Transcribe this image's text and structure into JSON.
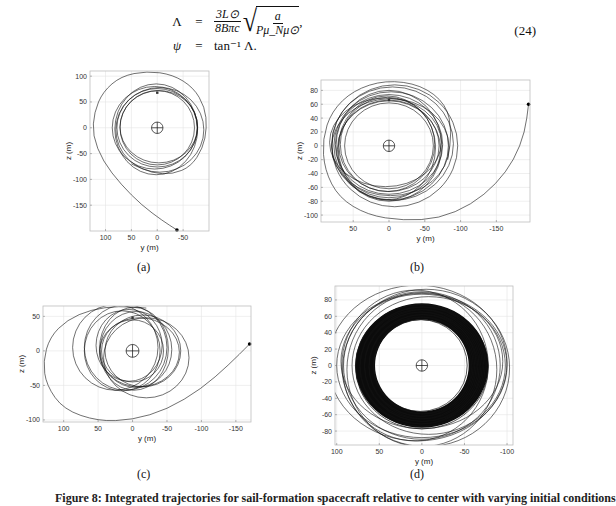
{
  "equation": {
    "number": "(24)",
    "line1": {
      "lhs": "Λ",
      "eq": "=",
      "frac_num": "3L⊙",
      "frac_den": "8Bπc",
      "sqrt_num": "a",
      "sqrt_den": "Pμ_Nμ⊙",
      "trail": ","
    },
    "line2": {
      "lhs": "ψ",
      "eq": "=",
      "rhs": "tan⁻¹ Λ."
    }
  },
  "caption": {
    "text": "Figure 8: Integrated trajectories for sail-formation spacecraft relative to center with varying initial conditions"
  },
  "chart_data": [
    {
      "id": "a",
      "sublabel": "(a)",
      "type": "line",
      "xlabel": "y (m)",
      "ylabel": "z (m)",
      "xlim": [
        130,
        -100
      ],
      "ylim": [
        -200,
        110
      ],
      "xticks": [
        100,
        50,
        0,
        -50
      ],
      "yticks": [
        100,
        50,
        0,
        -50,
        -100,
        -150
      ],
      "grid": true,
      "start_point": [
        -38,
        -198
      ],
      "approach": [
        [
          -38,
          -198
        ],
        [
          -10,
          -180
        ],
        [
          30,
          -150
        ],
        [
          70,
          -110
        ],
        [
          105,
          -65
        ],
        [
          125,
          -15
        ],
        [
          122,
          30
        ],
        [
          105,
          70
        ],
        [
          70,
          100
        ],
        [
          20,
          110
        ],
        [
          -30,
          103
        ],
        [
          -70,
          78
        ],
        [
          -92,
          40
        ],
        [
          -96,
          0
        ],
        [
          -88,
          -40
        ],
        [
          -65,
          -75
        ],
        [
          -30,
          -90
        ],
        [
          10,
          -88
        ],
        [
          50,
          -70
        ]
      ],
      "rings": [
        [
          0,
          0,
          72,
          72
        ],
        [
          0,
          0,
          78,
          76
        ],
        [
          -5,
          -4,
          85,
          82
        ],
        [
          2,
          -3,
          80,
          88
        ],
        [
          -3,
          2,
          75,
          70
        ],
        [
          5,
          0,
          82,
          80
        ]
      ],
      "marker": [
        0,
        68
      ],
      "target_radius": 8
    },
    {
      "id": "b",
      "sublabel": "(b)",
      "type": "line",
      "xlabel": "y (m)",
      "ylabel": "z (m)",
      "xlim": [
        95,
        -197
      ],
      "ylim": [
        -110,
        95
      ],
      "xticks": [
        50,
        0,
        -50,
        -100,
        -150
      ],
      "yticks": [
        80,
        60,
        40,
        20,
        0,
        -20,
        -40,
        -60,
        -80,
        -100
      ],
      "grid": true,
      "start_point": [
        -195,
        60
      ],
      "approach": [
        [
          -195,
          60
        ],
        [
          -190,
          20
        ],
        [
          -175,
          -20
        ],
        [
          -150,
          -55
        ],
        [
          -115,
          -85
        ],
        [
          -70,
          -105
        ],
        [
          -20,
          -108
        ],
        [
          30,
          -100
        ],
        [
          70,
          -75
        ],
        [
          90,
          -35
        ],
        [
          93,
          10
        ],
        [
          80,
          50
        ],
        [
          50,
          80
        ],
        [
          5,
          95
        ],
        [
          -45,
          88
        ],
        [
          -80,
          60
        ],
        [
          -88,
          20
        ],
        [
          -82,
          -20
        ]
      ],
      "rings": [
        [
          0,
          0,
          62,
          62
        ],
        [
          0,
          0,
          70,
          66
        ],
        [
          0,
          2,
          75,
          72
        ],
        [
          -3,
          0,
          80,
          78
        ],
        [
          3,
          -3,
          68,
          75
        ],
        [
          -5,
          3,
          85,
          82
        ],
        [
          0,
          -5,
          72,
          70
        ],
        [
          5,
          5,
          78,
          64
        ],
        [
          -8,
          0,
          88,
          88
        ],
        [
          2,
          2,
          66,
          68
        ],
        [
          0,
          0,
          74,
          80
        ],
        [
          -2,
          -2,
          82,
          70
        ]
      ],
      "marker": [
        0,
        66
      ],
      "target_radius": 8
    },
    {
      "id": "c",
      "sublabel": "(c)",
      "type": "line",
      "xlabel": "y (m)",
      "ylabel": "z (m)",
      "xlim": [
        130,
        -172
      ],
      "ylim": [
        -103,
        65
      ],
      "xticks": [
        100,
        50,
        0,
        -50,
        -100,
        -150
      ],
      "yticks": [
        50,
        0,
        -50,
        -100
      ],
      "grid": true,
      "start_point": [
        -170,
        10
      ],
      "approach": [
        [
          -170,
          10
        ],
        [
          -140,
          -20
        ],
        [
          -100,
          -55
        ],
        [
          -50,
          -85
        ],
        [
          0,
          -100
        ],
        [
          50,
          -102
        ],
        [
          100,
          -85
        ],
        [
          125,
          -50
        ],
        [
          130,
          -15
        ],
        [
          120,
          20
        ],
        [
          95,
          45
        ],
        [
          60,
          60
        ],
        [
          20,
          65
        ],
        [
          -20,
          62
        ]
      ],
      "rings": [
        [
          0,
          0,
          45,
          45
        ],
        [
          -5,
          2,
          52,
          55
        ],
        [
          10,
          5,
          60,
          62
        ],
        [
          -10,
          -2,
          58,
          50
        ],
        [
          15,
          0,
          55,
          58
        ],
        [
          -20,
          -10,
          62,
          58
        ],
        [
          5,
          8,
          48,
          52
        ],
        [
          -2,
          3,
          50,
          60
        ],
        [
          25,
          5,
          62,
          62
        ],
        [
          -15,
          0,
          55,
          52
        ]
      ],
      "marker": [
        0,
        48
      ],
      "target_radius": 9
    },
    {
      "id": "d",
      "sublabel": "(d)",
      "type": "line",
      "xlabel": "y (m)",
      "ylabel": "z (m)",
      "xlim": [
        102,
        -107
      ],
      "ylim": [
        -97,
        97
      ],
      "xticks": [
        100,
        50,
        0,
        -50,
        -100
      ],
      "yticks": [
        80,
        60,
        40,
        20,
        0,
        -20,
        -40,
        -60,
        -80
      ],
      "grid": true,
      "start_point": null,
      "approach": [],
      "rings": [
        [
          0,
          0,
          100,
          88
        ],
        [
          5,
          3,
          105,
          95
        ],
        [
          -5,
          -3,
          98,
          96
        ],
        [
          0,
          0,
          92,
          90
        ],
        [
          8,
          0,
          86,
          92
        ],
        [
          -8,
          0,
          90,
          84
        ],
        [
          0,
          5,
          95,
          82
        ],
        [
          0,
          -5,
          88,
          94
        ]
      ],
      "dense_band": {
        "inner": [
          55,
          56
        ],
        "outer": [
          78,
          76
        ]
      },
      "marker": null,
      "target_radius": 8
    }
  ]
}
